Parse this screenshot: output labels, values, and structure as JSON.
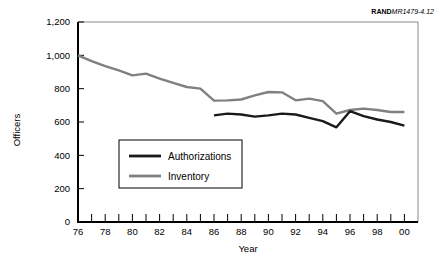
{
  "figure": {
    "rand_mark": "RAND",
    "rand_number": "MR1479-4.12"
  },
  "chart_data": {
    "type": "line",
    "title": "",
    "xlabel": "Year",
    "ylabel": "Officers",
    "xlim": [
      1976,
      2001
    ],
    "ylim": [
      0,
      1200
    ],
    "ytick_values": [
      0,
      200,
      400,
      600,
      800,
      1000,
      1200
    ],
    "ytick_labels": [
      "0",
      "200",
      "400",
      "600",
      "800",
      "1,000",
      "1,200"
    ],
    "xtick_values": [
      1976,
      1978,
      1980,
      1982,
      1984,
      1986,
      1988,
      1990,
      1992,
      1994,
      1996,
      1998,
      2000
    ],
    "xtick_labels": [
      "76",
      "78",
      "80",
      "82",
      "84",
      "86",
      "88",
      "90",
      "92",
      "94",
      "96",
      "98",
      "00"
    ],
    "xtick_minor_values": [
      1977,
      1979,
      1981,
      1983,
      1985,
      1987,
      1989,
      1991,
      1993,
      1995,
      1997,
      1999
    ],
    "grid": false,
    "legend_position": "lower-left",
    "series": [
      {
        "name": "Authorizations",
        "color": "#1a1a1a",
        "x": [
          1986,
          1987,
          1988,
          1989,
          1990,
          1991,
          1992,
          1993,
          1994,
          1995,
          1996,
          1997,
          1998,
          1999,
          2000
        ],
        "values": [
          640,
          650,
          645,
          632,
          640,
          650,
          645,
          625,
          605,
          568,
          665,
          635,
          615,
          600,
          578
        ]
      },
      {
        "name": "Inventory",
        "color": "#808080",
        "x": [
          1976,
          1977,
          1978,
          1979,
          1980,
          1981,
          1982,
          1983,
          1984,
          1985,
          1986,
          1987,
          1988,
          1989,
          1990,
          1991,
          1992,
          1993,
          1994,
          1995,
          1996,
          1997,
          1998,
          1999,
          2000
        ],
        "values": [
          1000,
          965,
          935,
          910,
          880,
          890,
          860,
          835,
          810,
          800,
          728,
          730,
          735,
          760,
          780,
          778,
          730,
          740,
          725,
          650,
          672,
          680,
          672,
          660,
          660
        ]
      }
    ]
  },
  "legend": {
    "items": [
      {
        "label": "Authorizations",
        "color": "#1a1a1a"
      },
      {
        "label": "Inventory",
        "color": "#808080"
      }
    ]
  }
}
